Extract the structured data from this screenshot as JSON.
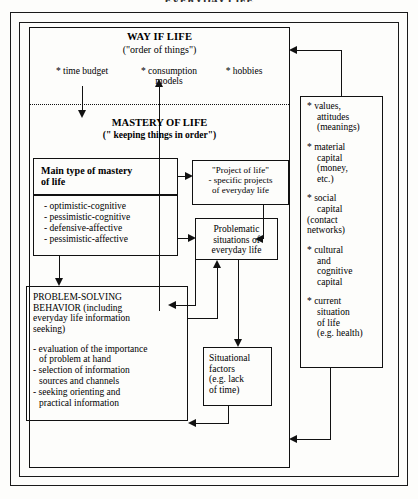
{
  "diagram": {
    "title_partial": "EVERYDAY LIFE",
    "way_of_life": {
      "title": "WAY IF LIFE",
      "subtitle": "(\"order of things\")",
      "bullets": [
        "* time budget",
        "* consumption\nmodels",
        "* hobbies"
      ],
      "bullet_time": "* time budget",
      "bullet_consumption_1": "* consumption",
      "bullet_consumption_2": "models",
      "bullet_hobbies": "* hobbies"
    },
    "mastery_of_life": {
      "title": "MASTERY OF LIFE",
      "subtitle": "(\" keeping things in order\")"
    },
    "main_type_box": {
      "line1": "Main type of mastery",
      "line2": "of life"
    },
    "types_box": {
      "items": [
        "- optimistic-cognitive",
        "- pessimistic-cognitive",
        "- defensive-affective",
        "- pessimistic-affective"
      ]
    },
    "project_box": {
      "line1": "\"Project of life\"",
      "line2": "- specific projects",
      "line3": "of everyday life"
    },
    "problematic_box": {
      "line1": "Problematic",
      "line2": "situations of",
      "line3": "everyday life"
    },
    "problem_solving_box": {
      "head_line1": "PROBLEM-SOLVING",
      "head_line2": "BEHAVIOR (including",
      "head_line3": "everyday life information",
      "head_line4": "seeking)",
      "items": [
        {
          "main": "- evaluation of the importance",
          "cont": "of problem at hand"
        },
        {
          "main": "- selection of information",
          "cont": "sources and channels"
        },
        {
          "main": "- seeking orienting and",
          "cont": "practical information"
        }
      ]
    },
    "situational_box": {
      "line1": "Situational",
      "line2": "factors",
      "line3": "(e.g. lack",
      "line4": "of time)"
    },
    "resources_box": {
      "groups": [
        {
          "l0": "* values,",
          "l1": "attitudes",
          "l2": "(meanings)",
          "l3": ""
        },
        {
          "l0": "* material",
          "l1": "capital",
          "l2": "(money,",
          "l3": "etc.)"
        },
        {
          "l0": "* social",
          "l1": "capital",
          "l2": "(contact",
          "l3": "networks)"
        },
        {
          "l0": "* cultural",
          "l1": "and",
          "l2": "cognitive",
          "l3": "capital"
        },
        {
          "l0": "* current",
          "l1": "situation",
          "l2": "of life",
          "l3": "(e.g. health)"
        }
      ]
    },
    "colors": {
      "stroke": "#111111",
      "background": "#fdfdfb",
      "text": "#000000"
    }
  }
}
